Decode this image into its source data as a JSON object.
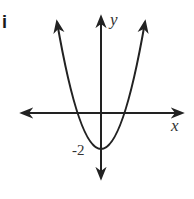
{
  "problem_label": "i",
  "axes": {
    "x_label": "x",
    "y_label": "y"
  },
  "annotations": {
    "y_intercept": "-2"
  },
  "curve": {
    "type": "parabola",
    "opens": "up",
    "vertex": [
      0,
      -2
    ],
    "stroke": "#222222"
  }
}
